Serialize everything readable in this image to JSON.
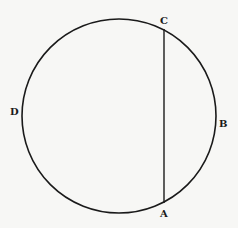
{
  "diagram": {
    "type": "circle-with-chord",
    "circle": {
      "cx": 119,
      "cy": 116,
      "r": 97
    },
    "chord": {
      "from": "C",
      "to": "A"
    },
    "points": [
      {
        "label": "C",
        "x": 164,
        "y": 29,
        "label_x": 160,
        "label_y": 24
      },
      {
        "label": "A",
        "x": 164,
        "y": 203,
        "label_x": 160,
        "label_y": 217
      },
      {
        "label": "D",
        "x": 22,
        "y": 112,
        "label_x": 10,
        "label_y": 115
      },
      {
        "label": "B",
        "x": 216,
        "y": 123,
        "label_x": 219,
        "label_y": 127
      }
    ],
    "stroke_color": "#1a1a1a",
    "background_color": "#f7f7f5"
  }
}
